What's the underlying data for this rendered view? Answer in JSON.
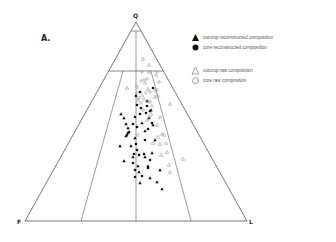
{
  "figure": {
    "panel_label": "A.",
    "vertices": {
      "top": "Q",
      "left": "F",
      "right": "L"
    }
  },
  "legend": {
    "items": [
      {
        "symbol": "filled-triangle",
        "label": "outcrop  reconstructed composition"
      },
      {
        "symbol": "filled-circle",
        "label": "core  reconstructed composition"
      },
      {
        "symbol": "open-triangle",
        "label": "outcrop  raw composition"
      },
      {
        "symbol": "open-circle",
        "label": "core  raw composition"
      }
    ]
  },
  "chart_data": {
    "type": "scatter",
    "subtype": "ternary QFL diagram",
    "title": "A.",
    "axes": {
      "apex": "Q",
      "bottom_left": "F",
      "bottom_right": "L"
    },
    "field_boundaries": [
      "horizontal line near top (~Q 90%)",
      "horizontal line at ~Q 75%",
      "central vertical line from Q to F-L midpoint",
      "left field line F:L ~1:3 region boundary",
      "right field line"
    ],
    "series": [
      {
        "name": "outcrop reconstructed composition",
        "marker": "filled-triangle",
        "points_px": [
          [
            121,
            114
          ],
          [
            124,
            118
          ],
          [
            126,
            124
          ],
          [
            128,
            128
          ],
          [
            126,
            136
          ],
          [
            120,
            146
          ],
          [
            124,
            161
          ],
          [
            131,
            146
          ],
          [
            133,
            157
          ],
          [
            138,
            166
          ],
          [
            139,
            172
          ],
          [
            145,
            157
          ],
          [
            148,
            166
          ],
          [
            140,
            183
          ],
          [
            150,
            178
          ],
          [
            157,
            182
          ],
          [
            162,
            189
          ],
          [
            160,
            170
          ],
          [
            152,
            153
          ],
          [
            155,
            140
          ],
          [
            145,
            131
          ],
          [
            142,
            123
          ],
          [
            149,
            118
          ],
          [
            153,
            125
          ],
          [
            135,
            138
          ],
          [
            147,
            101
          ],
          [
            151,
            110
          ]
        ]
      },
      {
        "name": "core reconstructed composition",
        "marker": "filled-circle",
        "points_px": [
          [
            153,
            88
          ],
          [
            137,
            105
          ],
          [
            141,
            108
          ],
          [
            147,
            106
          ],
          [
            150,
            111
          ],
          [
            135,
            117
          ],
          [
            140,
            114
          ],
          [
            133,
            124
          ],
          [
            129,
            132
          ],
          [
            127,
            135
          ],
          [
            136,
            144
          ],
          [
            137,
            150
          ],
          [
            134,
            154
          ],
          [
            139,
            155
          ],
          [
            133,
            163
          ],
          [
            135,
            170
          ],
          [
            135,
            177
          ],
          [
            148,
            168
          ],
          [
            150,
            160
          ],
          [
            142,
            176
          ],
          [
            144,
            154
          ],
          [
            145,
            140
          ],
          [
            148,
            129
          ],
          [
            152,
            123
          ],
          [
            137,
            127
          ],
          [
            146,
            113
          ],
          [
            140,
            92
          ],
          [
            136,
            96
          ],
          [
            128,
            133
          ]
        ]
      },
      {
        "name": "outcrop raw composition",
        "marker": "open-triangle",
        "points_px": [
          [
            143,
            59
          ],
          [
            149,
            65
          ],
          [
            149,
            72
          ],
          [
            156,
            75
          ],
          [
            127,
            88
          ],
          [
            142,
            95
          ],
          [
            170,
            104
          ],
          [
            160,
            117
          ],
          [
            157,
            125
          ],
          [
            162,
            134
          ],
          [
            158,
            137
          ],
          [
            164,
            135
          ],
          [
            153,
            143
          ],
          [
            160,
            144
          ],
          [
            166,
            143
          ],
          [
            161,
            155
          ],
          [
            167,
            152
          ],
          [
            183,
            159
          ],
          [
            169,
            165
          ],
          [
            170,
            172
          ],
          [
            151,
            114
          ],
          [
            147,
            120
          ],
          [
            155,
            97
          ],
          [
            148,
            89
          ],
          [
            138,
            100
          ],
          [
            145,
            83
          ]
        ]
      },
      {
        "name": "core raw composition",
        "marker": "open-circle",
        "points_px": [
          [
            142,
            72
          ],
          [
            157,
            72
          ],
          [
            141,
            81
          ],
          [
            144,
            80
          ],
          [
            147,
            79
          ],
          [
            159,
            82
          ],
          [
            137,
            87
          ],
          [
            146,
            93
          ],
          [
            150,
            92
          ],
          [
            155,
            91
          ],
          [
            157,
            90
          ],
          [
            137,
            93
          ],
          [
            158,
            96
          ],
          [
            139,
            98
          ],
          [
            144,
            99
          ],
          [
            148,
            101
          ],
          [
            150,
            102
          ],
          [
            141,
            103
          ],
          [
            152,
            106
          ],
          [
            143,
            110
          ],
          [
            149,
            117
          ],
          [
            138,
            135
          ]
        ]
      }
    ]
  }
}
